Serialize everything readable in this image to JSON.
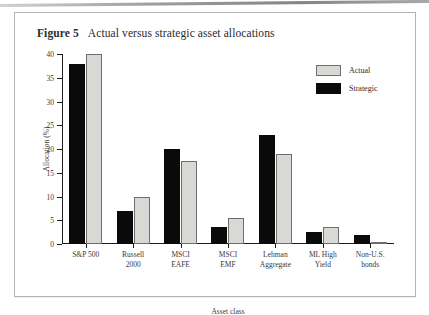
{
  "figure": {
    "number_label": "Figure 5",
    "title": "Actual versus strategic asset allocations"
  },
  "legend": {
    "position": "top-right",
    "items": [
      {
        "label": "Actual",
        "color": "#d8d8d4"
      },
      {
        "label": "Strategic",
        "color": "#0a0a0a"
      }
    ]
  },
  "chart_data": {
    "type": "bar",
    "title": "Actual versus strategic asset allocations",
    "xlabel": "Asset class",
    "ylabel": "Allocation (%)",
    "ylim": [
      0,
      40
    ],
    "yticks": [
      0,
      5,
      10,
      15,
      20,
      25,
      30,
      35,
      40
    ],
    "ytick_labels": [
      "0",
      "5",
      "10",
      "15",
      "20",
      "25",
      "30",
      "35",
      "40"
    ],
    "grid": false,
    "legend_position": "top-right",
    "categories": [
      "S&P 500",
      "Russell 2000",
      "MSCI EAFE",
      "MSCI EMF",
      "Lehman Aggregate",
      "ML High Yield",
      "Non-U.S. bonds"
    ],
    "category_lines": [
      [
        "S&P 500"
      ],
      [
        "Russell",
        "2000"
      ],
      [
        "MSCI",
        "EAFE"
      ],
      [
        "MSCI",
        "EMF"
      ],
      [
        "Lehman",
        "Aggregate"
      ],
      [
        "ML High",
        "Yield"
      ],
      [
        "Non-U.S.",
        "bonds"
      ]
    ],
    "series": [
      {
        "name": "Strategic",
        "color": "#0a0a0a",
        "values": [
          38,
          7,
          20,
          3.5,
          23,
          2.5,
          2
        ]
      },
      {
        "name": "Actual",
        "color": "#d8d8d4",
        "values": [
          40,
          10,
          17.5,
          5.5,
          19,
          3.5,
          0.5
        ]
      }
    ]
  }
}
